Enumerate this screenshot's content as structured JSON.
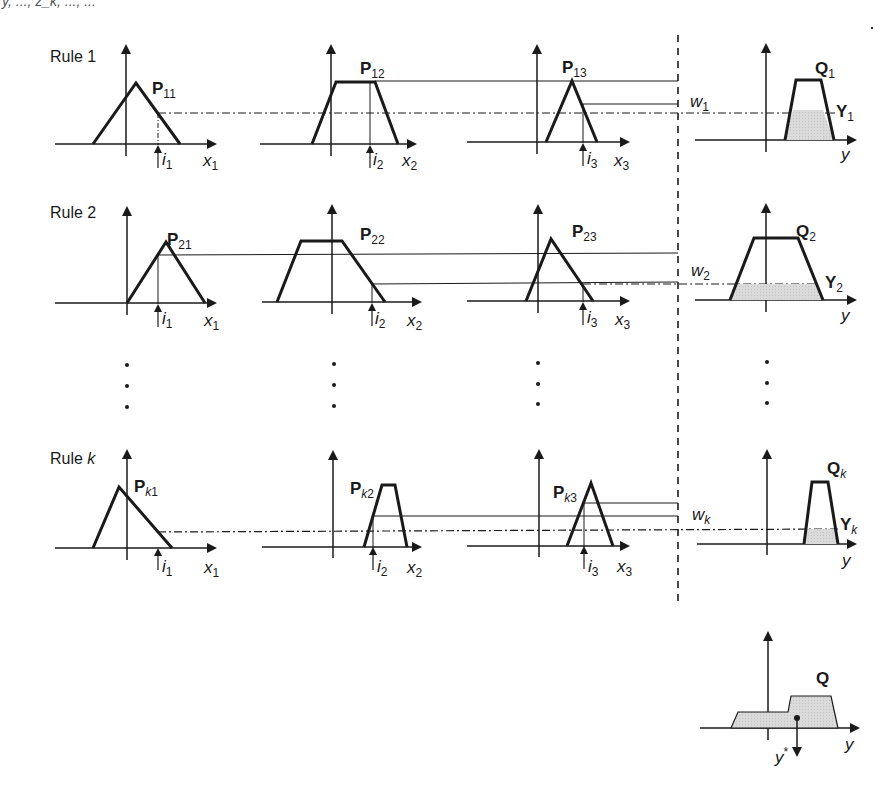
{
  "header": {
    "fragment": "y, ..., z_k, ..., ..."
  },
  "rules": [
    {
      "label": "Rule 1",
      "antecedents": [
        {
          "name": "P",
          "sub": "11",
          "input": "i",
          "input_sub": "1",
          "axis": "x",
          "axis_sub": "1",
          "shape": "triangle"
        },
        {
          "name": "P",
          "sub": "12",
          "input": "i",
          "input_sub": "2",
          "axis": "x",
          "axis_sub": "2",
          "shape": "trapezoid"
        },
        {
          "name": "P",
          "sub": "13",
          "input": "i",
          "input_sub": "3",
          "axis": "x",
          "axis_sub": "3",
          "shape": "triangle"
        }
      ],
      "weight": {
        "name": "w",
        "sub": "1"
      },
      "consequent": {
        "name": "Q",
        "sub": "1",
        "clipped": "Y",
        "clipped_sub": "1",
        "axis": "y"
      }
    },
    {
      "label": "Rule 2",
      "antecedents": [
        {
          "name": "P",
          "sub": "21",
          "input": "i",
          "input_sub": "1",
          "axis": "x",
          "axis_sub": "1",
          "shape": "triangle"
        },
        {
          "name": "P",
          "sub": "22",
          "input": "i",
          "input_sub": "2",
          "axis": "x",
          "axis_sub": "2",
          "shape": "trapezoid"
        },
        {
          "name": "P",
          "sub": "23",
          "input": "i",
          "input_sub": "3",
          "axis": "x",
          "axis_sub": "3",
          "shape": "triangle"
        }
      ],
      "weight": {
        "name": "w",
        "sub": "2"
      },
      "consequent": {
        "name": "Q",
        "sub": "2",
        "clipped": "Y",
        "clipped_sub": "2",
        "axis": "y"
      }
    },
    {
      "label_prefix": "Rule ",
      "label_var": "k",
      "antecedents": [
        {
          "name": "P",
          "sub_var": "k",
          "sub": "1",
          "input": "i",
          "input_sub": "1",
          "axis": "x",
          "axis_sub": "1",
          "shape": "triangle"
        },
        {
          "name": "P",
          "sub_var": "k",
          "sub": "2",
          "input": "i",
          "input_sub": "2",
          "axis": "x",
          "axis_sub": "2",
          "shape": "trapezoid"
        },
        {
          "name": "P",
          "sub_var": "k",
          "sub": "3",
          "input": "i",
          "input_sub": "3",
          "axis": "x",
          "axis_sub": "3",
          "shape": "triangle"
        }
      ],
      "weight": {
        "name": "w",
        "sub": "k"
      },
      "consequent": {
        "name": "Q",
        "sub": "k",
        "clipped": "Y",
        "clipped_sub": "k",
        "axis": "y"
      }
    }
  ],
  "aggregate": {
    "name": "Q",
    "axis": "y",
    "output": "y",
    "output_sup": "*"
  },
  "colors": {
    "line": "#1a1a1a",
    "fill": "#d9d9d9"
  }
}
